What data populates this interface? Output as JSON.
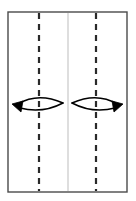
{
  "diagram": {
    "title": "Folding diagram: rectangular sheet with two vertical fold lines and rotation arrows",
    "caption": "",
    "background_color": "#ffffff",
    "sheet": {
      "name": "paper-sheet",
      "shape": "rectangle",
      "x": 8,
      "y": 12,
      "width": 119,
      "height": 180,
      "stroke_color": "#4a4a4a",
      "stroke_width": 1.4,
      "fill_color": "#ffffff"
    },
    "center_line": {
      "name": "center-crease-line",
      "style": "solid",
      "orientation": "vertical",
      "x": 68,
      "y_top": 13,
      "y_bottom": 191,
      "color": "#c8c8c8",
      "stroke_width": 1.2
    },
    "fold_lines": [
      {
        "name": "left-fold-line",
        "style": "dashed",
        "orientation": "vertical",
        "x": 39,
        "y_top": 13,
        "y_bottom": 191,
        "color": "#2a2a2a",
        "stroke_width": 2.2,
        "dash_length": 6,
        "gap_length": 5
      },
      {
        "name": "right-fold-line",
        "style": "dashed",
        "orientation": "vertical",
        "x": 96,
        "y_top": 13,
        "y_bottom": 191,
        "color": "#2a2a2a",
        "stroke_width": 2.2,
        "dash_length": 6,
        "gap_length": 5
      }
    ],
    "rotation_arrows": [
      {
        "name": "left-rotation-arrow",
        "direction": "left",
        "description": "lens-shaped rotation arrow pointing left, wrapping the left fold line",
        "center_x": 38,
        "center_y": 103,
        "half_width": 25,
        "half_height": 7,
        "tip_x": 13,
        "tail_x": 63,
        "color": "#000000",
        "stroke_width": 1.5,
        "arrowhead": "filled-triangle"
      },
      {
        "name": "right-rotation-arrow",
        "direction": "right",
        "description": "lens-shaped rotation arrow pointing right, wrapping the right fold line",
        "center_x": 97,
        "center_y": 103,
        "half_width": 25,
        "half_height": 7,
        "tip_x": 122,
        "tail_x": 72,
        "color": "#000000",
        "stroke_width": 1.5,
        "arrowhead": "filled-triangle"
      }
    ]
  }
}
